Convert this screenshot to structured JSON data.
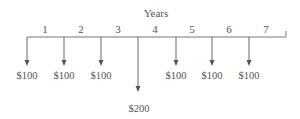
{
  "diagram": {
    "title": "Years",
    "type": "cash-flow-diagram",
    "years": [
      "1",
      "2",
      "3",
      "4",
      "5",
      "6",
      "7"
    ],
    "cash_flows": [
      {
        "time": 0,
        "amount": "$100",
        "direction": "down"
      },
      {
        "time": 1,
        "amount": "$100",
        "direction": "down"
      },
      {
        "time": 2,
        "amount": "$100",
        "direction": "down"
      },
      {
        "time": 3,
        "amount": "$200",
        "direction": "down"
      },
      {
        "time": 4,
        "amount": "$100",
        "direction": "down"
      },
      {
        "time": 5,
        "amount": "$100",
        "direction": "down"
      },
      {
        "time": 6,
        "amount": "$100",
        "direction": "down"
      }
    ],
    "colors": {
      "line": "#666666",
      "text": "#555555"
    }
  }
}
